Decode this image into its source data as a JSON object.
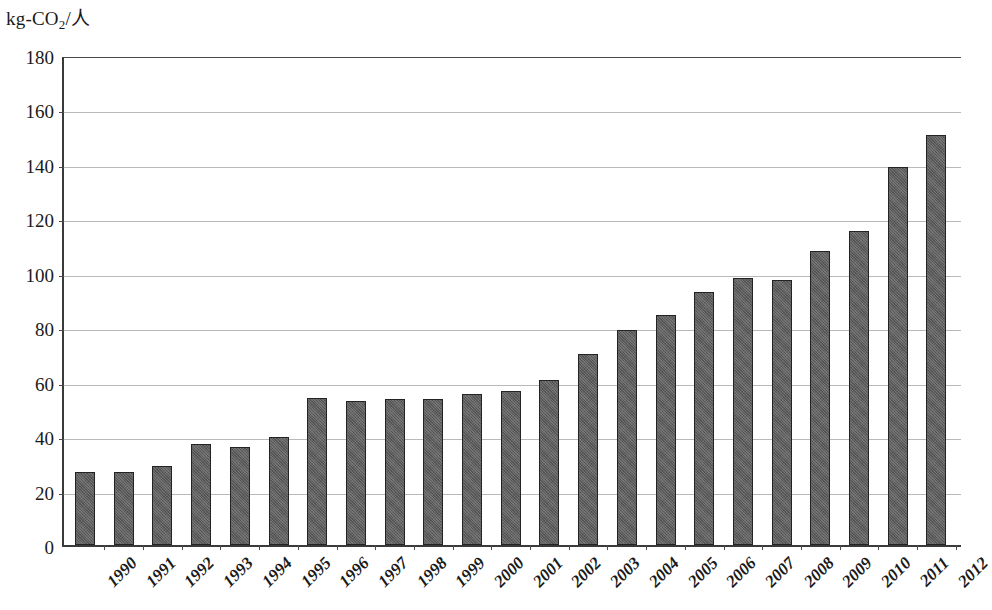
{
  "chart_data": {
    "type": "bar",
    "title": "",
    "subtitle": "",
    "xlabel": "",
    "ylabel": "kg-CO2/人",
    "ylabel_parts": {
      "prefix": "kg-CO",
      "sub": "2",
      "suffix": "/人"
    },
    "ylim": [
      0,
      180
    ],
    "ytick_step": 20,
    "yticks": [
      "0",
      "20",
      "40",
      "60",
      "80",
      "100",
      "120",
      "140",
      "160",
      "180"
    ],
    "grid": true,
    "grid_axis": "y",
    "legend": false,
    "legend_position": "none",
    "bar_color": "#5d5d5d",
    "bar_edge_color": "#232323",
    "grid_color": "#b9b9b9",
    "axis_color": "#3a3a3a",
    "categories": [
      "1990",
      "1991",
      "1992",
      "1993",
      "1994",
      "1995",
      "1996",
      "1997",
      "1998",
      "1999",
      "2000",
      "2001",
      "2002",
      "2003",
      "2004",
      "2005",
      "2006",
      "2007",
      "2008",
      "2009",
      "2010",
      "2011",
      "2012"
    ],
    "values": [
      27,
      27,
      29,
      37,
      36,
      39.5,
      54,
      53,
      53.5,
      53.5,
      55.5,
      56.5,
      60.5,
      70,
      79,
      84.5,
      93,
      98,
      97.5,
      108,
      115.5,
      139,
      150.5
    ]
  }
}
